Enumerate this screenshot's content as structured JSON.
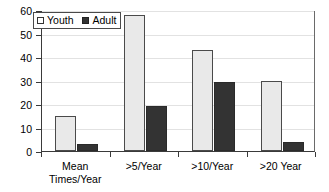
{
  "chart_data": {
    "type": "bar",
    "title": "",
    "xlabel": "",
    "ylabel": "",
    "ylim": [
      0,
      60
    ],
    "yticks": [
      0,
      10,
      20,
      30,
      40,
      50,
      60
    ],
    "ytick_labels": [
      "0",
      "10",
      "20",
      "30",
      "40",
      "50",
      "60"
    ],
    "grid": true,
    "legend_position": "top-left",
    "categories": [
      "Mean\nTimes/Year",
      ">5/Year",
      ">10/Year",
      ">20 Year"
    ],
    "series": [
      {
        "name": "Youth",
        "color": "#e9e9e9",
        "values": [
          15,
          58,
          43,
          30
        ]
      },
      {
        "name": "Adult",
        "color": "#333333",
        "values": [
          3,
          19,
          29.5,
          4
        ]
      }
    ]
  },
  "legend": {
    "entries": [
      {
        "label": "Youth",
        "marker": "open-square-marker"
      },
      {
        "label": "Adult",
        "marker": "filled-square-marker"
      }
    ]
  },
  "colors": {
    "youth_fill": "#e9e9e9",
    "adult_fill": "#333333",
    "axis": "#3a3a3a",
    "gridline": "#e2e2e2",
    "background": "#ffffff"
  }
}
